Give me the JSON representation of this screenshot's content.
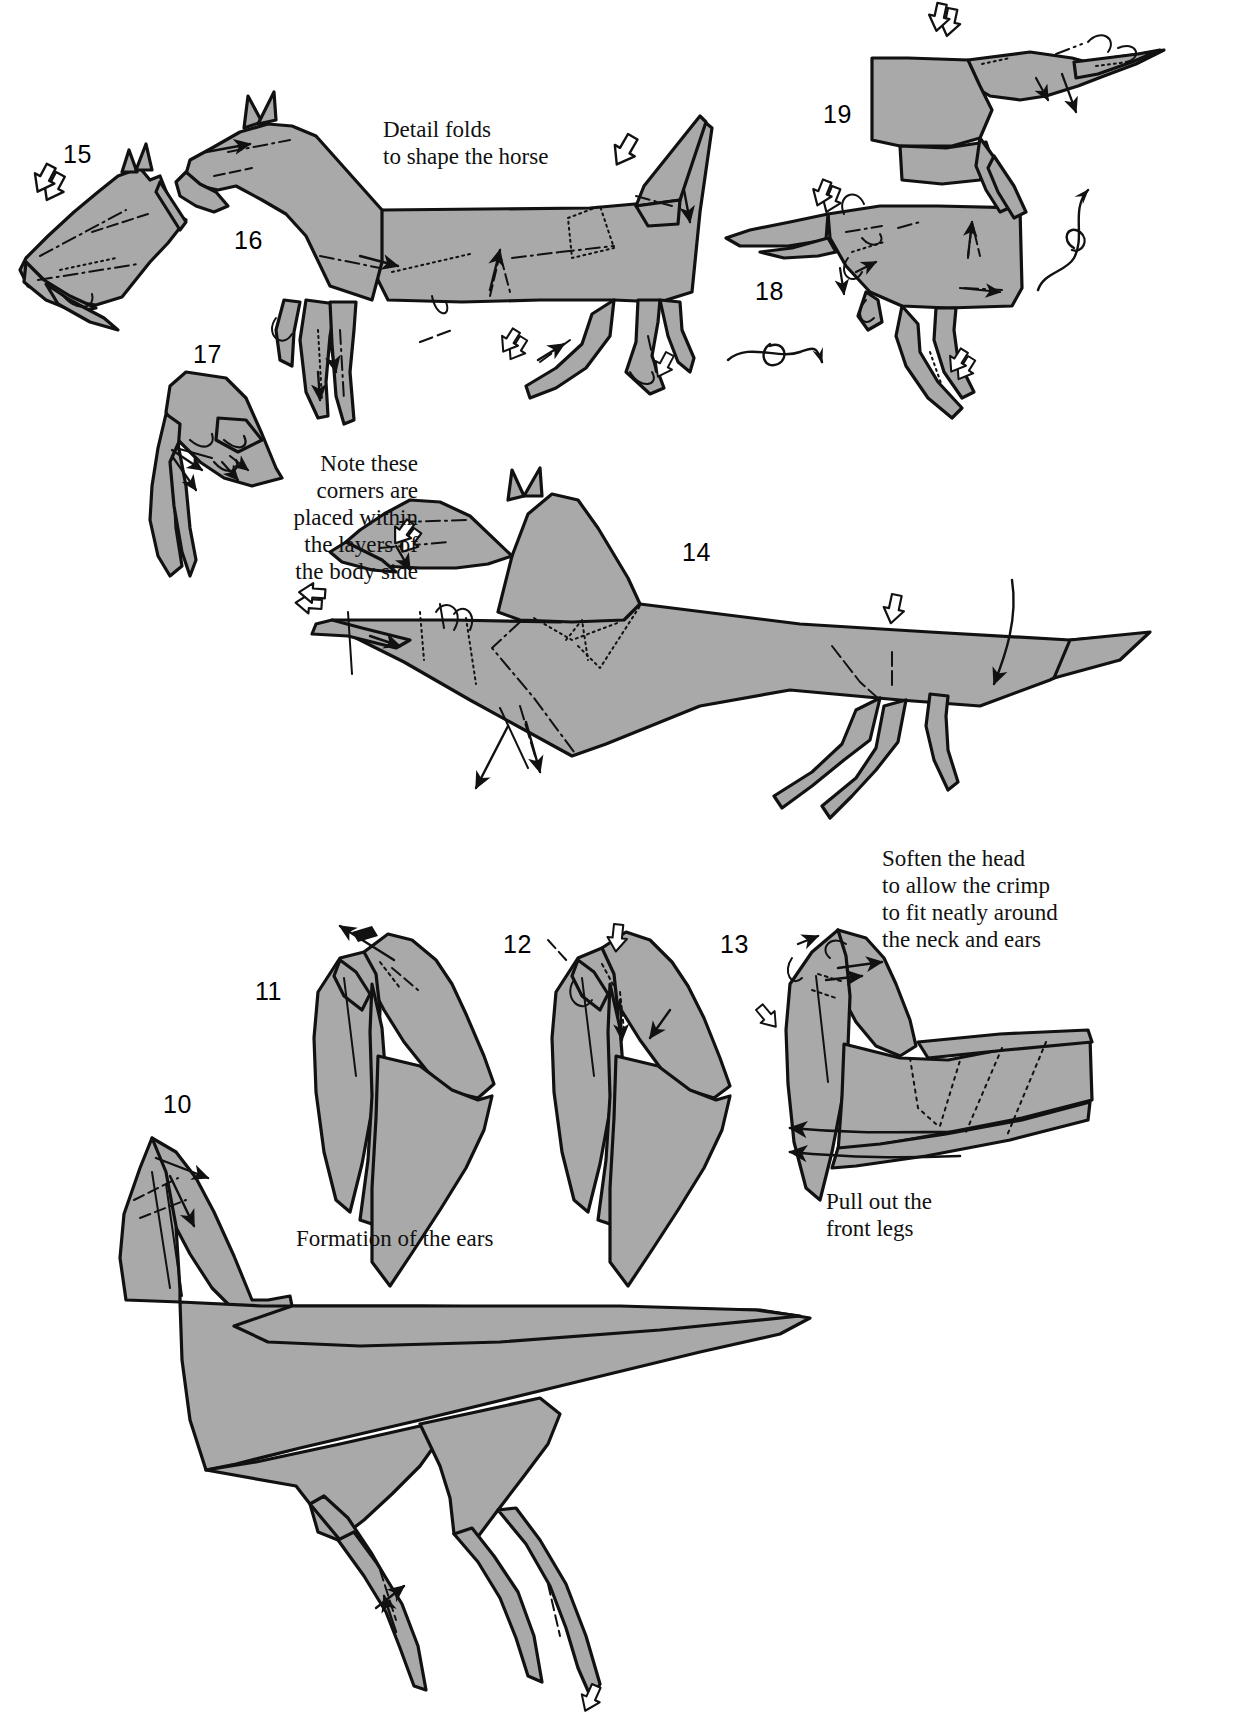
{
  "page": {
    "kind": "origami-instruction-diagram",
    "subject": "horse",
    "width": 1238,
    "height": 1727,
    "background_color": "#ffffff",
    "paper_fill_color": "#a9a9a9",
    "outline_color": "#111111",
    "fold_line_color": "#111111"
  },
  "steps": [
    {
      "id": "step-10",
      "number": "10",
      "x": 163,
      "y": 1090
    },
    {
      "id": "step-11",
      "number": "11",
      "x": 255,
      "y": 977
    },
    {
      "id": "step-12",
      "number": "12",
      "x": 503,
      "y": 930
    },
    {
      "id": "step-13",
      "number": "13",
      "x": 720,
      "y": 930
    },
    {
      "id": "step-14",
      "number": "14",
      "x": 682,
      "y": 538
    },
    {
      "id": "step-15",
      "number": "15",
      "x": 63,
      "y": 140
    },
    {
      "id": "step-16",
      "number": "16",
      "x": 234,
      "y": 226
    },
    {
      "id": "step-17",
      "number": "17",
      "x": 193,
      "y": 340
    },
    {
      "id": "step-18",
      "number": "18",
      "x": 755,
      "y": 277
    },
    {
      "id": "step-19",
      "number": "19",
      "x": 823,
      "y": 100
    }
  ],
  "captions": [
    {
      "id": "caption-detail-folds",
      "text": "Detail folds\nto shape the horse",
      "align": "left",
      "x": 383,
      "y": 116,
      "width": 270
    },
    {
      "id": "caption-note-corners",
      "text": "Note these\ncorners are\nplaced within\nthe layers of\nthe body side",
      "align": "right",
      "x": 196,
      "y": 450,
      "width": 222
    },
    {
      "id": "caption-soften-head",
      "text": "Soften the head\nto allow the crimp\nto fit neatly around\nthe neck and ears",
      "align": "left",
      "x": 882,
      "y": 845,
      "width": 300
    },
    {
      "id": "caption-pull-out-front-legs",
      "text": "Pull out the\nfront legs",
      "align": "left",
      "x": 826,
      "y": 1188,
      "width": 220
    },
    {
      "id": "caption-formation-of-ears",
      "text": "Formation of the ears",
      "align": "left",
      "x": 296,
      "y": 1225,
      "width": 300
    }
  ],
  "symbols": {
    "hollow_arrow": "push-arrow",
    "solid_arrow": "fold-arrow",
    "rotate_loop": "turn-over-arrow",
    "valley_fold": "dashed-line",
    "mountain_fold": "dash-dot-line",
    "hidden_edge": "dotted-line"
  }
}
